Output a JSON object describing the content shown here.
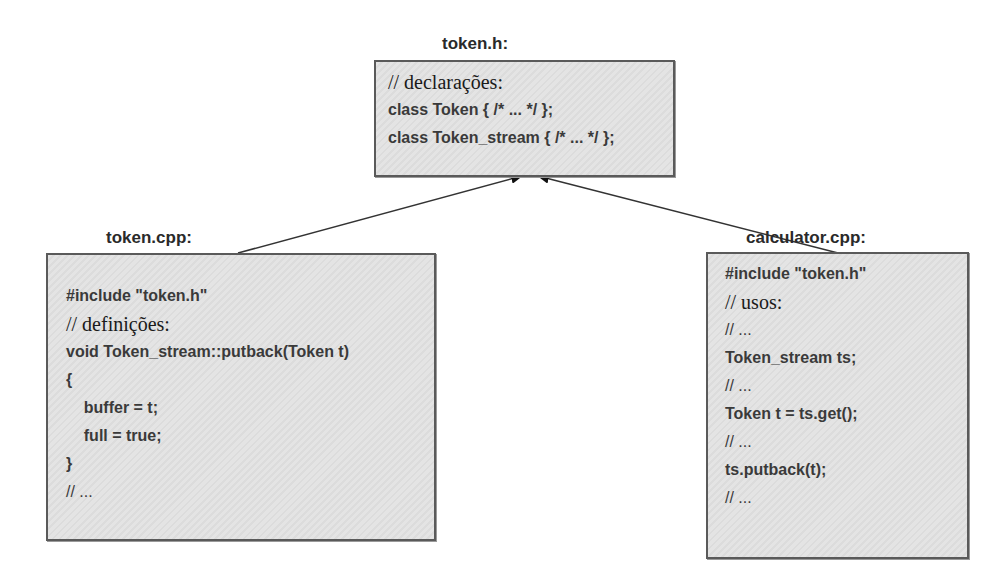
{
  "files": {
    "header": {
      "label": "token.h:",
      "lines": [
        {
          "text": "// declarações:",
          "style": "serif"
        },
        {
          "text": "class Token { /* ... */ };",
          "style": "code"
        },
        {
          "text": "class Token_stream { /* ... */ };",
          "style": "code"
        }
      ]
    },
    "impl": {
      "label": "token.cpp:",
      "lines": [
        {
          "text": "#include \"token.h\"",
          "style": "code"
        },
        {
          "text": "// definições:",
          "style": "serif"
        },
        {
          "text": "void Token_stream::putback(Token t)",
          "style": "code"
        },
        {
          "text": "{",
          "style": "code"
        },
        {
          "text": "    buffer = t;",
          "style": "code"
        },
        {
          "text": "    full = true;",
          "style": "code"
        },
        {
          "text": "}",
          "style": "code"
        },
        {
          "text": "// ...",
          "style": "cmt"
        }
      ]
    },
    "user": {
      "label": "calculator.cpp:",
      "lines": [
        {
          "text": "#include \"token.h\"",
          "style": "code"
        },
        {
          "text": "// usos:",
          "style": "serif"
        },
        {
          "text": "// ...",
          "style": "cmt"
        },
        {
          "text": "Token_stream ts;",
          "style": "code"
        },
        {
          "text": "// ...",
          "style": "cmt"
        },
        {
          "text": "Token t = ts.get();",
          "style": "code"
        },
        {
          "text": "// ...",
          "style": "cmt"
        },
        {
          "text": "ts.putback(t);",
          "style": "code"
        },
        {
          "text": "// ...",
          "style": "cmt"
        }
      ]
    }
  },
  "arrows": [
    {
      "from": "token.cpp",
      "to": "token.h"
    },
    {
      "from": "calculator.cpp",
      "to": "token.h"
    }
  ],
  "colors": {
    "border": "#5a5a5a",
    "fill": "#e0e0e0",
    "text": "#3a3a3a"
  }
}
